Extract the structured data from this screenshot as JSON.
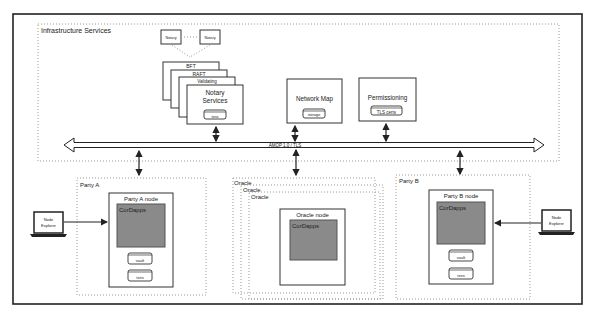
{
  "diagram": {
    "infrastructure": {
      "title": "Infrastructure Services",
      "notary_peers": [
        "Notary",
        "Notary"
      ],
      "notary_stack": [
        "BFT",
        "RAFT",
        "Validating"
      ],
      "notary_services": {
        "title_line1": "Notary",
        "title_line2": "Services",
        "store": "txns"
      },
      "network_map": {
        "title": "Network Map",
        "store": "storage"
      },
      "permissioning": {
        "title": "Permissioning",
        "store": "TLS certs"
      }
    },
    "bus": {
      "label": "AMQP 1.0 / TLS"
    },
    "party_a": {
      "title": "Party A",
      "node_title": "Party A node",
      "cordapps": "CorDapps",
      "stores": [
        "vault",
        "txns"
      ],
      "explorer": {
        "line1": "Node",
        "line2": "Explorer"
      }
    },
    "oracle": {
      "stack": [
        "Oracle",
        "Oracle",
        "Oracle"
      ],
      "node_title": "Oracle node",
      "cordapps": "CorDapps"
    },
    "party_b": {
      "title": "Party B",
      "node_title": "Party B node",
      "cordapps": "CorDapps",
      "stores": [
        "vault",
        "txns"
      ],
      "explorer": {
        "line1": "Node",
        "line2": "Explorer"
      }
    },
    "colors": {
      "border": "#222222",
      "dotted": "#9a9a9a",
      "cordapps_fill": "#8a8a8a"
    }
  }
}
